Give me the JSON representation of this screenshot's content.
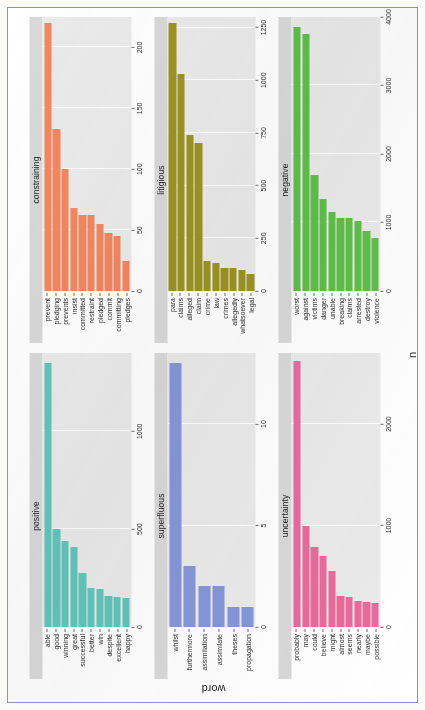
{
  "figure": {
    "axis_title_word": "word",
    "axis_title_n": "n",
    "border_color": "#8d8fc0",
    "panel_background": "#ebebeb",
    "strip_background": "#d9d9d9"
  },
  "chart_data": {
    "type": "bar",
    "title": "",
    "xlabel": "n",
    "ylabel": "word",
    "orientation": "horizontal",
    "grid": true,
    "legend": "none",
    "facets": [
      {
        "name": "positive",
        "color": "#62c6bb",
        "xlim": [
          0,
          1400
        ],
        "xticks": [
          0,
          500,
          1000
        ],
        "categories": [
          "happy",
          "excellent",
          "despite",
          "win",
          "better",
          "successful",
          "great",
          "winning",
          "good",
          "able"
        ],
        "values": [
          150,
          152,
          158,
          196,
          198,
          275,
          410,
          440,
          500,
          1350
        ]
      },
      {
        "name": "constraining",
        "color": "#f4875f",
        "xlim": [
          0,
          225
        ],
        "xticks": [
          0,
          50,
          100,
          150,
          200
        ],
        "categories": [
          "pledges",
          "committing",
          "commit",
          "pledged",
          "restraint",
          "committed",
          "insist",
          "prevents",
          "pledging",
          "prevent"
        ],
        "values": [
          25,
          45,
          48,
          55,
          62,
          62,
          68,
          100,
          133,
          220
        ]
      },
      {
        "name": "superfluous",
        "color": "#8697db",
        "xlim": [
          0,
          13.5
        ],
        "xticks": [
          0,
          5,
          10
        ],
        "categories": [
          "propagation",
          "theses",
          "assimilate",
          "assimilation",
          "furthermore",
          "whilst"
        ],
        "values": [
          1,
          1,
          2,
          2,
          3,
          13
        ]
      },
      {
        "name": "litigious",
        "color": "#9c9420",
        "xlim": [
          0,
          1300
        ],
        "xticks": [
          0,
          250,
          500,
          750,
          1000,
          1250
        ],
        "categories": [
          "legal",
          "whatsoever",
          "allegedly",
          "crimes",
          "law",
          "crime",
          "claim",
          "alleged",
          "claims",
          "para"
        ],
        "values": [
          80,
          100,
          110,
          110,
          135,
          140,
          700,
          740,
          1030,
          1270
        ]
      },
      {
        "name": "uncertainty",
        "color": "#ea6a9c",
        "xlim": [
          0,
          2700
        ],
        "xticks": [
          0,
          1000,
          2000
        ],
        "categories": [
          "possible",
          "maybe",
          "nearly",
          "seems",
          "almost",
          "might",
          "believe",
          "could",
          "may",
          "probably"
        ],
        "values": [
          240,
          250,
          260,
          300,
          310,
          550,
          700,
          790,
          1000,
          2620
        ]
      },
      {
        "name": "negative",
        "color": "#5fc04a",
        "xlim": [
          0,
          4000
        ],
        "xticks": [
          0,
          1000,
          2000,
          3000,
          4000
        ],
        "categories": [
          "violence",
          "destroy",
          "arrested",
          "claims",
          "breaking",
          "unable",
          "danger",
          "victims",
          "against",
          "worst"
        ],
        "values": [
          780,
          880,
          1020,
          1070,
          1070,
          1150,
          1350,
          1700,
          3750,
          3850
        ]
      }
    ]
  }
}
